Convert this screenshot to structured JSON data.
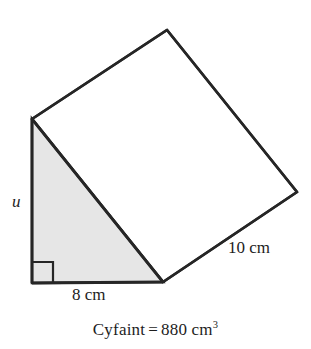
{
  "figure": {
    "type": "triangular-prism",
    "colors": {
      "stroke": "#262626",
      "front_face_fill": "#e6e6e6",
      "top_face_fill": "#ffffff",
      "background": "#ffffff"
    },
    "stroke_width": 2.6,
    "vertices": {
      "front_top": [
        32,
        119
      ],
      "front_bottom_left": [
        32,
        283
      ],
      "front_bottom_right": [
        163,
        282
      ],
      "back_top": [
        167,
        30
      ],
      "back_right": [
        297,
        192
      ]
    },
    "right_angle_marker": {
      "corner": [
        32,
        283
      ],
      "size": 21
    }
  },
  "labels": {
    "height": "u",
    "base": "8 cm",
    "depth": "10 cm"
  },
  "caption": {
    "quantity": "Cyfaint",
    "equals": "=",
    "value": "880",
    "unit": "cm",
    "exponent": "3"
  },
  "measurements": {
    "base_cm": 8,
    "depth_cm": 10,
    "height_label": "u",
    "volume_cm3": 880
  }
}
